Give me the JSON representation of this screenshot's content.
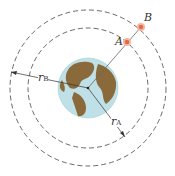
{
  "diagram": {
    "title": "",
    "labels": {
      "satellite_a": "A",
      "satellite_b": "B",
      "radius_a": "r",
      "radius_a_sub": "A",
      "radius_b": "r",
      "radius_b_sub": "B"
    },
    "elements": {
      "earth": {
        "cx": 88,
        "cy": 88,
        "r": 30,
        "ocean_color": "#bfe0e6",
        "land_color": "#8a6a3a"
      },
      "inner_orbit": {
        "cx": 88,
        "cy": 88,
        "r": 60,
        "style": "dashed"
      },
      "outer_orbit": {
        "cx": 88,
        "cy": 88,
        "r": 78,
        "style": "dashed"
      },
      "satellite_a": {
        "x": 127,
        "y": 42,
        "color": "#e8846a"
      },
      "satellite_b": {
        "x": 141,
        "y": 27,
        "color": "#e8846a"
      }
    }
  }
}
